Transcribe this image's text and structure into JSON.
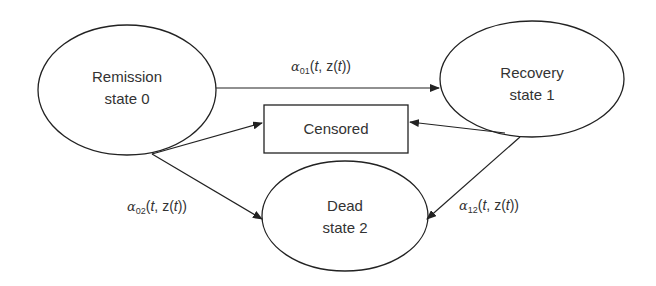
{
  "diagram": {
    "type": "multi-state transition diagram",
    "nodes": [
      {
        "id": "remission",
        "line1": "Remission",
        "line2": "state 0",
        "shape": "ellipse"
      },
      {
        "id": "recovery",
        "line1": "Recovery",
        "line2": "state 1",
        "shape": "ellipse"
      },
      {
        "id": "censored",
        "label": "Censored",
        "shape": "rectangle"
      },
      {
        "id": "dead",
        "line1": "Dead",
        "line2": "state 2",
        "shape": "ellipse"
      }
    ],
    "edges": [
      {
        "from": "remission",
        "to": "recovery",
        "symbol": "α",
        "sub": "01",
        "args_open": "(",
        "t": "t",
        "mid": ", z(",
        "t2": "t",
        "args_close": "))"
      },
      {
        "from": "remission",
        "to": "dead",
        "symbol": "α",
        "sub": "02",
        "args_open": "(",
        "t": "t",
        "mid": ", z(",
        "t2": "t",
        "args_close": "))"
      },
      {
        "from": "recovery",
        "to": "dead",
        "symbol": "α",
        "sub": "12",
        "args_open": "(",
        "t": "t",
        "mid": ", z(",
        "t2": "t",
        "args_close": "))"
      },
      {
        "from": "remission",
        "to": "censored"
      },
      {
        "from": "recovery",
        "to": "censored"
      }
    ],
    "stroke_color": "#222222"
  }
}
